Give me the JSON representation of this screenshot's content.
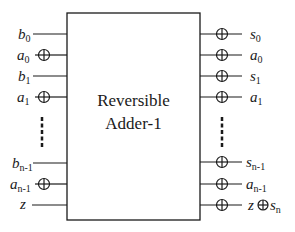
{
  "diagram": {
    "block": {
      "title_line1": "Reversible",
      "title_line2": "Adder-1",
      "x": 67,
      "y": 13,
      "width": 133,
      "height": 207
    },
    "inputs": [
      {
        "name": "b",
        "sub": "0",
        "y": 34,
        "xor": false
      },
      {
        "name": "a",
        "sub": "0",
        "y": 55,
        "xor": true
      },
      {
        "name": "b",
        "sub": "1",
        "y": 76,
        "xor": false
      },
      {
        "name": "a",
        "sub": "1",
        "y": 97,
        "xor": true
      },
      {
        "name": "b",
        "sub": "n-1",
        "y": 163,
        "xor": false
      },
      {
        "name": "a",
        "sub": "n-1",
        "y": 184,
        "xor": true
      },
      {
        "name": "z",
        "sub": "",
        "y": 205,
        "xor": false
      }
    ],
    "outputs": [
      {
        "name": "s",
        "sub": "0",
        "y": 34,
        "xor": true
      },
      {
        "name": "a",
        "sub": "0",
        "y": 55,
        "xor": true
      },
      {
        "name": "s",
        "sub": "1",
        "y": 76,
        "xor": true
      },
      {
        "name": "a",
        "sub": "1",
        "y": 97,
        "xor": true
      },
      {
        "name": "s",
        "sub": "n-1",
        "y": 162,
        "xor": true
      },
      {
        "name": "a",
        "sub": "n-1",
        "y": 184,
        "xor": true
      },
      {
        "name": "z⊕s",
        "sub": "n",
        "y": 205,
        "xor": true
      }
    ],
    "ellipsis": "vertical-dashes",
    "stroke_color": "#1a1a1a"
  }
}
